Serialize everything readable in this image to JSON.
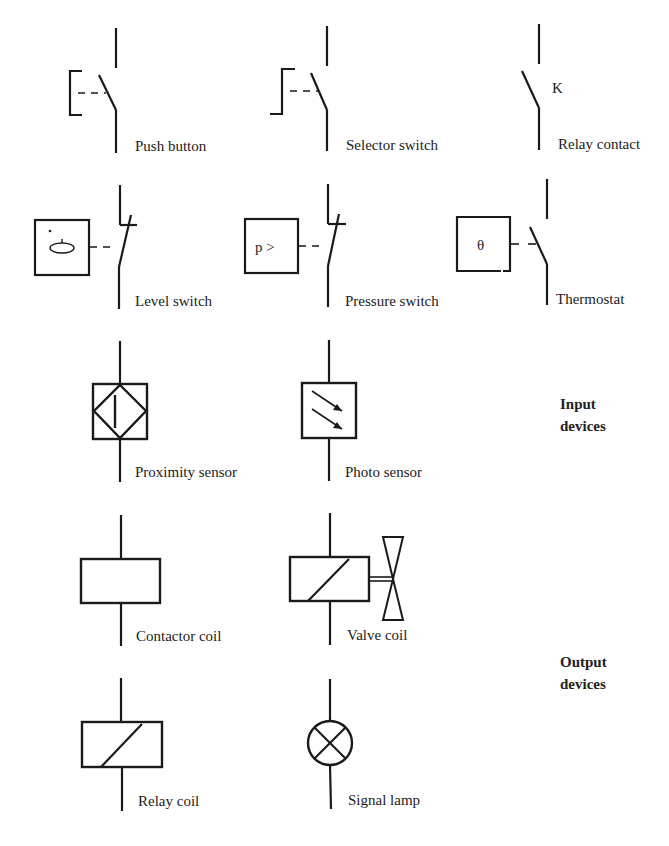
{
  "symbols": {
    "push_button": {
      "label": "Push button"
    },
    "selector_switch": {
      "label": "Selector switch"
    },
    "relay_contact": {
      "label": "Relay contact",
      "marker": "K"
    },
    "level_switch": {
      "label": "Level switch"
    },
    "pressure_switch": {
      "label": "Pressure switch",
      "marker": "p >"
    },
    "thermostat": {
      "label": "Thermostat",
      "marker": "θ"
    },
    "proximity_sensor": {
      "label": "Proximity sensor"
    },
    "photo_sensor": {
      "label": "Photo sensor"
    },
    "contactor_coil": {
      "label": "Contactor coil"
    },
    "valve_coil": {
      "label": "Valve coil"
    },
    "relay_coil": {
      "label": "Relay coil"
    },
    "signal_lamp": {
      "label": "Signal lamp"
    }
  },
  "groups": {
    "input": {
      "line1": "Input",
      "line2": "devices"
    },
    "output": {
      "line1": "Output",
      "line2": "devices"
    }
  },
  "colors": {
    "ink": "#1a1a1a",
    "background": "#ffffff"
  }
}
